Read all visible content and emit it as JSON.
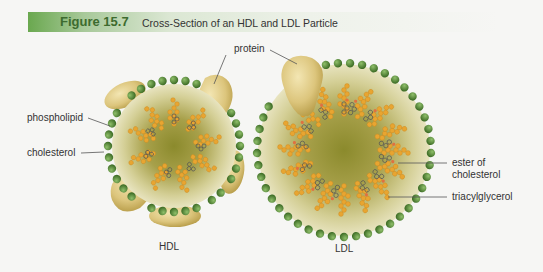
{
  "figure": {
    "number": "Figure 15.7",
    "title": "Cross-Section of an HDL and LDL Particle",
    "accent_color": "#3d6b2f"
  },
  "labels": {
    "protein": "protein",
    "phospholipid": "phospholipid",
    "cholesterol": "cholesterol",
    "ester_line1": "ester of",
    "ester_line2": "cholesterol",
    "triacylglycerol": "triacylglycerol"
  },
  "particles": [
    {
      "name": "HDL",
      "label": "HDL"
    },
    {
      "name": "LDL",
      "label": "LDL"
    }
  ],
  "colors": {
    "phospholipid_head": "#5a8a3a",
    "fatty_acid": "#e8a531",
    "core": "#8a8a2a",
    "protein": "#d9c27a"
  }
}
